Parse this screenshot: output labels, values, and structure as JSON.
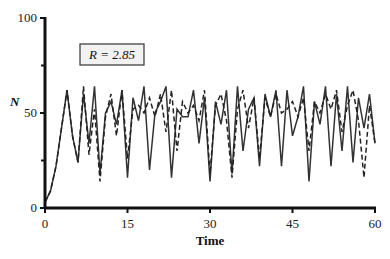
{
  "chart_data": {
    "type": "line",
    "title": "",
    "xlabel": "Time",
    "ylabel": "N",
    "xlim": [
      0,
      60
    ],
    "ylim": [
      0,
      100
    ],
    "x_ticks": [
      0,
      15,
      30,
      45,
      60
    ],
    "y_ticks": [
      0,
      50,
      100
    ],
    "y_minor_ticks": [
      25,
      75
    ],
    "grid": false,
    "legend": null,
    "annotation": {
      "text": "R = 2.85",
      "param": "R",
      "value": 2.85
    },
    "x": [
      0,
      1,
      2,
      3,
      4,
      5,
      6,
      7,
      8,
      9,
      10,
      11,
      12,
      13,
      14,
      15,
      16,
      17,
      18,
      19,
      20,
      21,
      22,
      23,
      24,
      25,
      26,
      27,
      28,
      29,
      30,
      31,
      32,
      33,
      34,
      35,
      36,
      37,
      38,
      39,
      40,
      41,
      42,
      43,
      44,
      45,
      46,
      47,
      48,
      49,
      50,
      51,
      52,
      53,
      54,
      55,
      56,
      57,
      58,
      59,
      60
    ],
    "series": [
      {
        "name": "solid",
        "style": "solid",
        "values": [
          3,
          9,
          22,
          42,
          62,
          38,
          24,
          60,
          34,
          64,
          18,
          50,
          56,
          44,
          62,
          16,
          58,
          46,
          64,
          20,
          50,
          56,
          64,
          16,
          52,
          48,
          48,
          62,
          34,
          58,
          14,
          56,
          44,
          62,
          18,
          64,
          30,
          52,
          58,
          22,
          60,
          48,
          62,
          22,
          62,
          38,
          48,
          64,
          14,
          56,
          44,
          64,
          22,
          60,
          30,
          64,
          24,
          58,
          42,
          60,
          34
        ]
      },
      {
        "name": "dashed",
        "style": "dashed",
        "values": [
          3,
          9,
          22,
          42,
          62,
          38,
          24,
          64,
          28,
          52,
          14,
          48,
          60,
          38,
          62,
          26,
          52,
          54,
          50,
          58,
          48,
          60,
          40,
          62,
          30,
          56,
          50,
          54,
          46,
          62,
          18,
          54,
          60,
          46,
          16,
          52,
          62,
          42,
          58,
          26,
          58,
          48,
          60,
          50,
          52,
          56,
          48,
          58,
          30,
          56,
          50,
          60,
          52,
          62,
          40,
          54,
          62,
          46,
          16,
          54,
          34
        ]
      }
    ]
  },
  "axes": {
    "x_tick_labels": [
      "0",
      "15",
      "30",
      "45",
      "60"
    ],
    "y_tick_labels": [
      "0",
      "50",
      "100"
    ],
    "x_title": "Time",
    "y_title": "N"
  },
  "annotation_box": {
    "label": "R = 2.85"
  }
}
